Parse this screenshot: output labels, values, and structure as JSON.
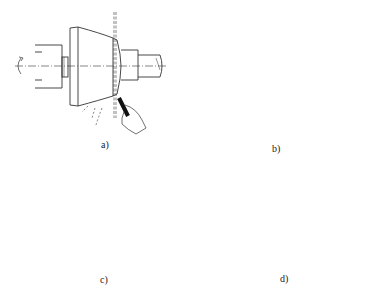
{
  "figure": {
    "panels": [
      {
        "id": "a",
        "label": "a)",
        "description": "Grinding tapered outer surface of cone with hand-held tool at narrow end"
      },
      {
        "id": "b",
        "label": "b)",
        "description": "Grinding hollow cone end face with hand-held tool, feed arrow leftward"
      },
      {
        "id": "c",
        "label": "c)",
        "description": "Grinding outer surface of closed-end sleeve between chuck and tailstock center, wheel traverse leftward"
      },
      {
        "id": "d",
        "label": "d)",
        "description": "Grinding outer surface of sleeve on mandrel between chuck and tailstock center, wheel traverse leftward"
      }
    ],
    "colors": {
      "line": "#333333",
      "hatch": "#444444",
      "background": "#ffffff",
      "wheel": "#888888"
    }
  }
}
